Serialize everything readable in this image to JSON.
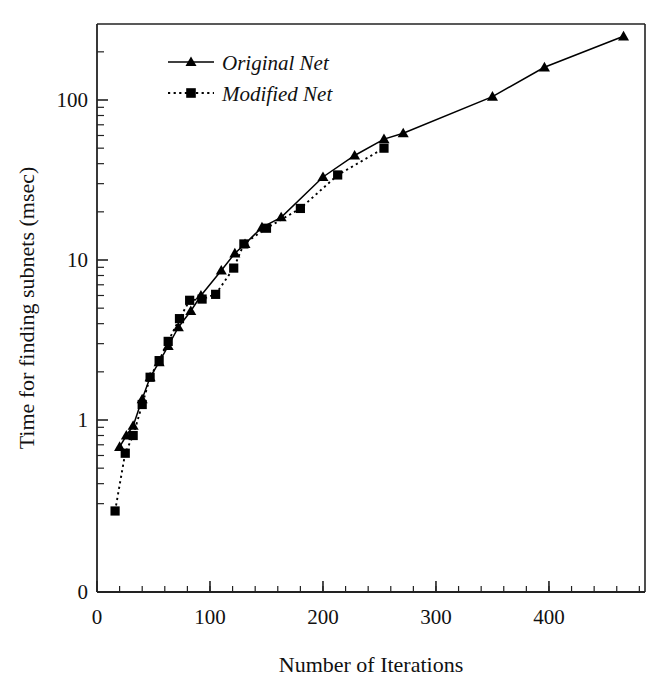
{
  "chart_data": {
    "type": "line",
    "title": "",
    "xlabel": "Number of Iterations",
    "ylabel": "Time for finding subnets (msec)",
    "yscale": "log",
    "xlim": [
      0,
      485
    ],
    "ylim": [
      0.2,
      330
    ],
    "xticks": [
      0,
      100,
      200,
      300,
      400
    ],
    "xtick_labels": [
      "0",
      "100",
      "200",
      "300",
      "400"
    ],
    "yticks": [
      1,
      10,
      100
    ],
    "ytick_labels": [
      "1",
      "10",
      "100"
    ],
    "y_origin_label": "0",
    "grid": false,
    "legend_position": "top-left-inside",
    "series": [
      {
        "name": "Original  Net",
        "marker": "triangle",
        "linestyle": "solid",
        "color": "#000000",
        "points": [
          [
            20,
            0.68
          ],
          [
            26,
            0.8
          ],
          [
            32,
            0.92
          ],
          [
            40,
            1.35
          ],
          [
            47,
            1.85
          ],
          [
            55,
            2.3
          ],
          [
            63,
            2.9
          ],
          [
            72,
            3.8
          ],
          [
            83,
            4.8
          ],
          [
            92,
            6.0
          ],
          [
            110,
            8.6
          ],
          [
            122,
            11.0
          ],
          [
            131,
            12.6
          ],
          [
            146,
            16.0
          ],
          [
            163,
            18.5
          ],
          [
            200,
            33.0
          ],
          [
            228,
            45.0
          ],
          [
            254,
            57.0
          ],
          [
            271,
            62.0
          ],
          [
            350,
            105.0
          ],
          [
            396,
            160.0
          ],
          [
            466,
            250.0
          ]
        ]
      },
      {
        "name": "Modified  Net",
        "marker": "square",
        "linestyle": "dotted",
        "color": "#000000",
        "points": [
          [
            16,
            0.27
          ],
          [
            25,
            0.62
          ],
          [
            32,
            0.8
          ],
          [
            40,
            1.25
          ],
          [
            47,
            1.85
          ],
          [
            55,
            2.35
          ],
          [
            63,
            3.1
          ],
          [
            73,
            4.3
          ],
          [
            82,
            5.6
          ],
          [
            93,
            5.7
          ],
          [
            105,
            6.1
          ],
          [
            121,
            8.9
          ],
          [
            130,
            12.6
          ],
          [
            150,
            15.8
          ],
          [
            180,
            21.0
          ],
          [
            213,
            34.0
          ],
          [
            254,
            50.0
          ]
        ]
      }
    ],
    "legend": [
      {
        "label": "Original  Net",
        "marker": "triangle",
        "linestyle": "solid"
      },
      {
        "label": "Modified  Net",
        "marker": "square",
        "linestyle": "dotted"
      }
    ]
  }
}
